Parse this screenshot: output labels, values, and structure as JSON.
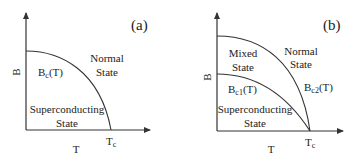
{
  "panels": [
    {
      "id": "a",
      "label": "(a)",
      "x_axis_label": "T",
      "y_axis_label": "B",
      "tc_label": "T",
      "tc_sub": "c",
      "curves": [
        {
          "name": "B_c(T)",
          "main": "B",
          "sub": "c",
          "arg": "(T)"
        }
      ],
      "regions": {
        "normal": [
          "Normal",
          "State"
        ],
        "superconducting": [
          "Superconducting",
          "State"
        ]
      }
    },
    {
      "id": "b",
      "label": "(b)",
      "x_axis_label": "T",
      "y_axis_label": "B",
      "tc_label": "T",
      "tc_sub": "c",
      "curves": [
        {
          "name": "B_c1(T)",
          "main": "B",
          "sub": "c1",
          "arg": "(T)"
        },
        {
          "name": "B_c2(T)",
          "main": "B",
          "sub": "c2",
          "arg": "(T)"
        }
      ],
      "regions": {
        "mixed": [
          "Mixed",
          "State"
        ],
        "normal": [
          "Normal",
          "State"
        ],
        "superconducting": [
          "Superconducting",
          "State"
        ]
      }
    }
  ],
  "colors": {
    "line": "#333333",
    "text": "#222222"
  }
}
